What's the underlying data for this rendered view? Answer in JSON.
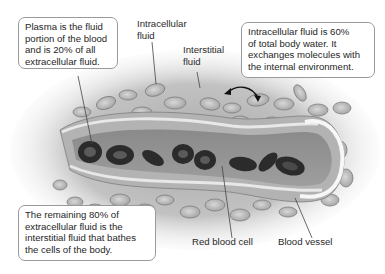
{
  "diagram": {
    "type": "illustration",
    "callouts": {
      "plasma": {
        "lines": [
          "Plasma is the fluid",
          "portion of the blood",
          "and is 20% of all",
          "extracellular fluid."
        ]
      },
      "intracellular": {
        "lines": [
          "Intracellular fluid is 60%",
          "of total body water. It",
          "exchanges molecules with",
          "the internal environment."
        ]
      },
      "interstitial": {
        "lines": [
          "The remaining 80% of",
          "extracellular fluid is the",
          "interstitial fluid that bathes",
          "the cells of the body."
        ]
      }
    },
    "labels": {
      "intracellular_fluid": [
        "Intracellular",
        "fluid"
      ],
      "interstitial_fluid": [
        "Interstitial",
        "fluid"
      ],
      "red_blood_cell": "Red blood cell",
      "blood_vessel": "Blood vessel"
    },
    "colors": {
      "background": "#ffffff",
      "callout_border": "#9a9a9a",
      "tissue_gray": "#9c9c9c",
      "vessel_wall": "#b8b8b8",
      "red_blood_cell": "#2e2e2e",
      "leader_line": "#444444"
    }
  }
}
